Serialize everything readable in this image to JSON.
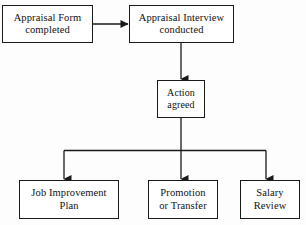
{
  "diagram": {
    "type": "flowchart",
    "background_color": "#fdfdfd",
    "line_color": "#1a1a1a",
    "box_fill_color": "#ffffff",
    "nodes": [
      {
        "id": "appraisal-form",
        "label": "Appraisal Form\ncompleted",
        "x": 2,
        "y": 5,
        "width": 91,
        "height": 38
      },
      {
        "id": "appraisal-interview",
        "label": "Appraisal Interview\nconducted",
        "x": 129,
        "y": 5,
        "width": 105,
        "height": 38
      },
      {
        "id": "action-agreed",
        "label": "Action\nagreed",
        "x": 157,
        "y": 80,
        "width": 48,
        "height": 38
      },
      {
        "id": "job-improvement",
        "label": "Job Improvement\nPlan",
        "x": 19,
        "y": 180,
        "width": 100,
        "height": 39
      },
      {
        "id": "promotion-transfer",
        "label": "Promotion\nor Transfer",
        "x": 148,
        "y": 180,
        "width": 70,
        "height": 39
      },
      {
        "id": "salary-review",
        "label": "Salary\nReview",
        "x": 240,
        "y": 180,
        "width": 60,
        "height": 39
      }
    ],
    "connectors": [
      {
        "id": "form-to-interview",
        "from": "appraisal-form",
        "to": "appraisal-interview",
        "orientation": "horizontal",
        "arrowhead": "right"
      },
      {
        "id": "interview-to-action",
        "from": "appraisal-interview",
        "to": "action-agreed",
        "orientation": "vertical",
        "arrowhead": "down"
      },
      {
        "id": "action-to-branch-bus",
        "from": "action-agreed",
        "to": "branch-bus",
        "orientation": "vertical",
        "arrowhead": "none"
      },
      {
        "id": "branch-to-job-improvement",
        "from": "branch-bus",
        "to": "job-improvement",
        "orientation": "vertical",
        "arrowhead": "down"
      },
      {
        "id": "branch-to-promotion-transfer",
        "from": "branch-bus",
        "to": "promotion-transfer",
        "orientation": "vertical",
        "arrowhead": "down"
      },
      {
        "id": "branch-to-salary-review",
        "from": "branch-bus",
        "to": "salary-review",
        "orientation": "vertical",
        "arrowhead": "down"
      }
    ]
  }
}
